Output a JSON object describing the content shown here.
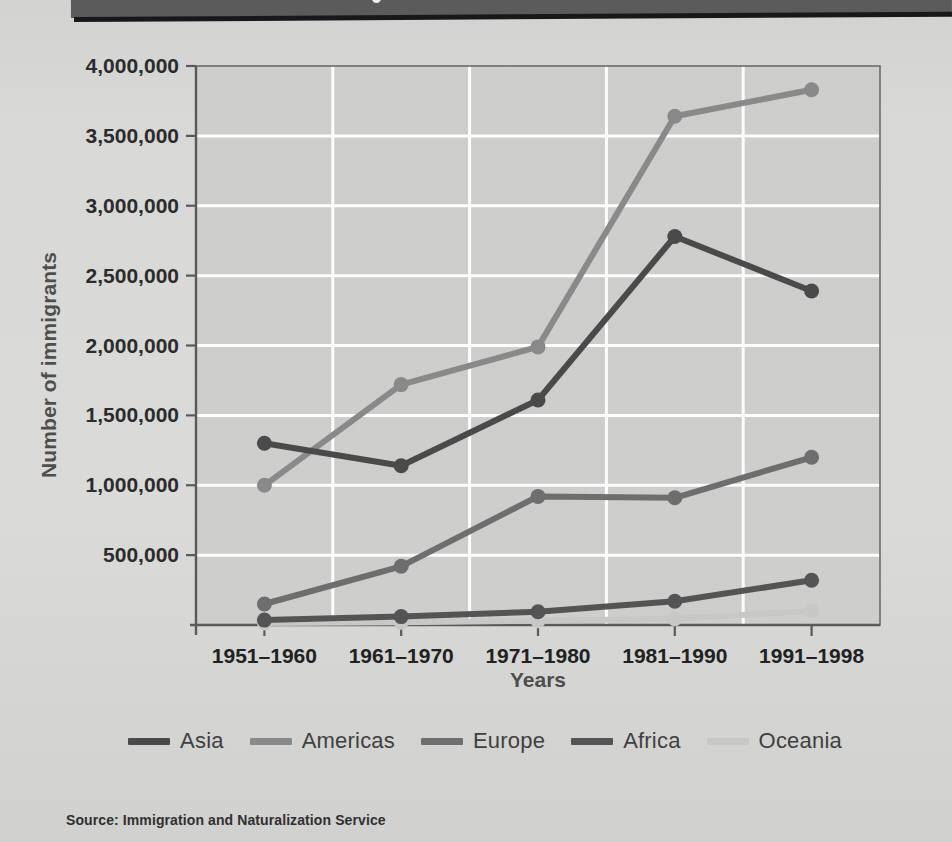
{
  "banner": {
    "present": true,
    "color": "#5b5b5b"
  },
  "axis": {
    "y_title": "Number of immigrants",
    "x_title": "Years"
  },
  "source": {
    "text": "Source:  Immigration and Naturalization Service"
  },
  "legend": {
    "items": [
      {
        "label": "Asia",
        "color": "#4a4a4a"
      },
      {
        "label": "Americas",
        "color": "#8a8a8a"
      },
      {
        "label": "Europe",
        "color": "#6e6e6e"
      },
      {
        "label": "Africa",
        "color": "#545454"
      },
      {
        "label": "Oceania",
        "color": "#c9c9c7"
      }
    ]
  },
  "chart_data": {
    "type": "line",
    "title": "",
    "xlabel": "Years",
    "ylabel": "Number of immigrants",
    "categories": [
      "1951–1960",
      "1961–1970",
      "1971–1980",
      "1981–1990",
      "1991–1998"
    ],
    "ytick_labels": [
      "500,000",
      "1,000,000",
      "1,500,000",
      "2,000,000",
      "2,500,000",
      "3,000,000",
      "3,500,000",
      "4,000,000"
    ],
    "ytick_values": [
      500000,
      1000000,
      1500000,
      2000000,
      2500000,
      3000000,
      3500000,
      4000000
    ],
    "ylim": [
      0,
      4000000
    ],
    "grid": true,
    "grid_color": "#ffffff",
    "plot_background": "#cfcfcd",
    "legend_position": "bottom",
    "series": [
      {
        "name": "Asia",
        "color": "#4a4a4a",
        "values": [
          1300000,
          1140000,
          1610000,
          2780000,
          2390000
        ]
      },
      {
        "name": "Americas",
        "color": "#8a8a8a",
        "values": [
          1000000,
          1720000,
          1990000,
          3640000,
          3830000
        ]
      },
      {
        "name": "Europe",
        "color": "#6e6e6e",
        "values": [
          150000,
          420000,
          920000,
          910000,
          1200000
        ]
      },
      {
        "name": "Africa",
        "color": "#545454",
        "values": [
          35000,
          60000,
          95000,
          170000,
          320000
        ]
      },
      {
        "name": "Oceania",
        "color": "#c9c9c7",
        "values": [
          15000,
          20000,
          30000,
          45000,
          100000
        ]
      }
    ]
  }
}
